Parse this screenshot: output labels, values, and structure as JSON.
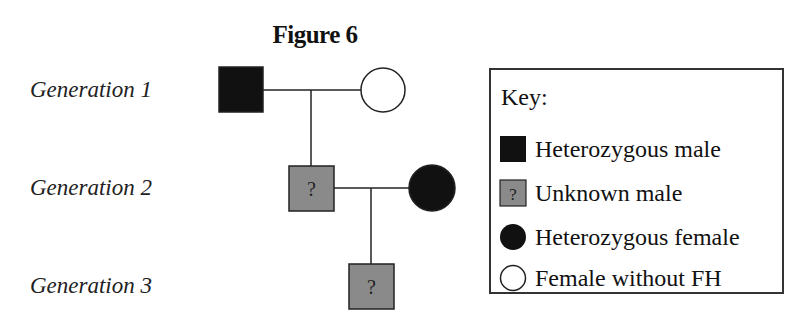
{
  "figure": {
    "title": "Figure 6"
  },
  "generations": [
    {
      "label": "Generation 1"
    },
    {
      "label": "Generation 2"
    },
    {
      "label": "Generation 3"
    }
  ],
  "pedigree": {
    "individuals": [
      {
        "id": "g1-male",
        "generation": 1,
        "sex": "male",
        "status": "Heterozygous male",
        "mark": ""
      },
      {
        "id": "g1-female",
        "generation": 1,
        "sex": "female",
        "status": "Female without FH",
        "mark": ""
      },
      {
        "id": "g2-male",
        "generation": 2,
        "sex": "male",
        "status": "Unknown male",
        "mark": "?"
      },
      {
        "id": "g2-female",
        "generation": 2,
        "sex": "female",
        "status": "Heterozygous female",
        "mark": ""
      },
      {
        "id": "g3-male",
        "generation": 3,
        "sex": "male",
        "status": "Unknown male",
        "mark": "?"
      }
    ],
    "colors": {
      "heterozygous": "#111111",
      "unknown": "#8a8a8a",
      "unaffected": "#ffffff",
      "line": "#222222"
    }
  },
  "key": {
    "title": "Key:",
    "items": [
      {
        "symbol": "filled-square",
        "label": "Heterozygous male"
      },
      {
        "symbol": "grey-square-question",
        "label": "Unknown male",
        "mark": "?"
      },
      {
        "symbol": "filled-circle",
        "label": "Heterozygous female"
      },
      {
        "symbol": "open-circle",
        "label": "Female without FH"
      }
    ]
  }
}
